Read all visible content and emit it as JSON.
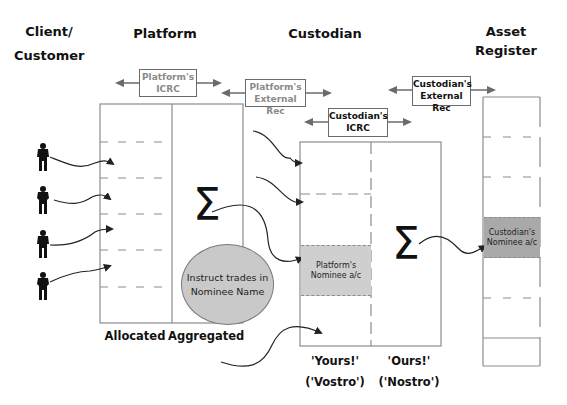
{
  "headers": {
    "client": "Client/\nCustomer",
    "client_line1": "Client/",
    "client_line2": "Customer",
    "platform": "Platform",
    "custodian": "Custodian",
    "asset_register_line1": "Asset",
    "asset_register_line2": "Register"
  },
  "reconciliation_boxes": {
    "platform_icrc": {
      "line1": "Platform's",
      "line2": "ICRC"
    },
    "platform_external_rec": {
      "line1": "Platform's",
      "line2": "External Rec"
    },
    "custodian_icrc": {
      "line1": "Custodian's",
      "line2": "ICRC"
    },
    "custodian_external_rec": {
      "line1": "Custodian's",
      "line2": "External Rec"
    }
  },
  "platform": {
    "column_labels": {
      "allocated": "Allocated",
      "aggregated": "Aggregated"
    },
    "sum_symbol": "Σ",
    "instruction_bubble": {
      "line1": "Instruct trades in",
      "line2": "Nominee Name"
    }
  },
  "custodian": {
    "sum_symbol": "Σ",
    "platform_nominee": {
      "line1": "Platform's",
      "line2": "Nominee a/c"
    },
    "column_labels": {
      "yours_line1": "'Yours!'",
      "yours_line2": "('Vostro')",
      "ours_line1": "'Ours!'",
      "ours_line2": "('Nostro')"
    }
  },
  "asset_register": {
    "custodian_nominee": {
      "line1": "Custodian's",
      "line2": "Nominee a/c"
    }
  },
  "clients": [
    {
      "icon": "businessman-icon"
    },
    {
      "icon": "businesswoman-icon"
    },
    {
      "icon": "businessman-icon"
    },
    {
      "icon": "businesswoman-icon"
    }
  ],
  "colors": {
    "box_border": "#8c8c8c",
    "account_fill": "#cfcfcf",
    "custodian_nominee_fill": "#a9a9a9",
    "ellipse_fill": "#c9c9c9",
    "text": "#111111",
    "muted_text": "#8a8a8a"
  }
}
